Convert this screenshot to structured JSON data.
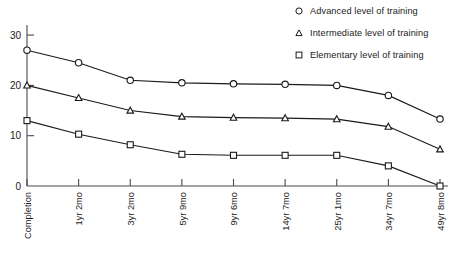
{
  "chart_data": {
    "type": "line",
    "title": "",
    "subtitle": "",
    "xlabel": "",
    "ylabel": "",
    "ylim": [
      0,
      32
    ],
    "yticks": [
      0,
      10,
      20,
      30
    ],
    "grid": false,
    "legend_position": "top-right",
    "categories": [
      "Completion",
      "1yr 2mo",
      "3yr 2mo",
      "5yr 9mo",
      "9yr 6mo",
      "14yr 7mo",
      "25yr 1mo",
      "34yr 7mo",
      "49yr 8mo"
    ],
    "series": [
      {
        "name": "Advanced level of training",
        "marker": "circle",
        "values": [
          27,
          24.5,
          21,
          20.5,
          20.3,
          20.2,
          20,
          18,
          13.3
        ]
      },
      {
        "name": "Intermediate level of training",
        "marker": "triangle",
        "values": [
          20,
          17.5,
          15,
          13.8,
          13.6,
          13.5,
          13.3,
          11.8,
          7.3
        ]
      },
      {
        "name": "Elementary level of training",
        "marker": "square",
        "values": [
          13,
          10.3,
          8.2,
          6.3,
          6.1,
          6.1,
          6.1,
          4,
          0
        ]
      }
    ]
  },
  "legend": {
    "items": [
      {
        "label": "Advanced level of training",
        "marker": "circle"
      },
      {
        "label": "Intermediate level of training",
        "marker": "triangle"
      },
      {
        "label": "Elementary level of training",
        "marker": "square"
      }
    ]
  },
  "axis": {
    "y_tick_labels": [
      "30",
      "20",
      "10",
      "0"
    ],
    "x_tick_labels": [
      "Completion",
      "1yr 2mo",
      "3yr 2mo",
      "5yr 9mo",
      "9yr 6mo",
      "14yr 7mo",
      "25yr 1mo",
      "34yr 7mo",
      "49yr 8mo"
    ]
  },
  "colors": {
    "line": "#1a1a1a",
    "axis": "#4a4a4a",
    "marker_fill": "#ffffff",
    "background": "#ffffff"
  }
}
